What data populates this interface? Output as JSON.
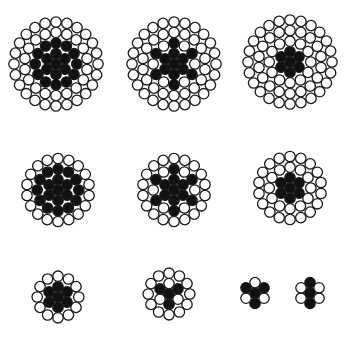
{
  "colors": {
    "background": "#ffffff",
    "steel": "#111111",
    "wire_fill": "#ffffff",
    "outline": "#1a1a1a"
  },
  "wire_radius": 5.2,
  "cross_sections": [
    {
      "id": "a",
      "cx": 56,
      "cy": 64,
      "rings": [
        {
          "n": 1,
          "r": 0,
          "fill": "steel"
        },
        {
          "n": 6,
          "r": 10.4,
          "fill": "steel"
        },
        {
          "n": 12,
          "r": 20.8,
          "fill": "steel"
        },
        {
          "n": 18,
          "r": 31.5,
          "fill": "white"
        },
        {
          "n": 24,
          "r": 42,
          "fill": "white"
        }
      ],
      "outer_only": false
    },
    {
      "id": "b",
      "cx": 174,
      "cy": 64,
      "rings": [
        {
          "n": 1,
          "r": 0,
          "fill": "steel"
        },
        {
          "n": 6,
          "r": 10.4,
          "fill": "steel"
        },
        {
          "n": 12,
          "r": 20.8,
          "fill": "star"
        },
        {
          "n": 18,
          "r": 31.5,
          "fill": "white"
        },
        {
          "n": 24,
          "r": 42,
          "fill": "white"
        }
      ]
    },
    {
      "id": "c",
      "cx": 290,
      "cy": 62,
      "rings": [
        {
          "n": 1,
          "r": 0,
          "fill": "steel"
        },
        {
          "n": 6,
          "r": 10.4,
          "fill": "steel"
        },
        {
          "n": 12,
          "r": 20.8,
          "fill": "white"
        },
        {
          "n": 18,
          "r": 31.5,
          "fill": "white"
        },
        {
          "n": 24,
          "r": 42,
          "fill": "white"
        }
      ]
    },
    {
      "id": "d",
      "cx": 58,
      "cy": 190,
      "rings": [
        {
          "n": 1,
          "r": 0,
          "fill": "steel"
        },
        {
          "n": 6,
          "r": 10.4,
          "fill": "steel"
        },
        {
          "n": 12,
          "r": 20.8,
          "fill": "steel"
        },
        {
          "n": 18,
          "r": 31.5,
          "fill": "white"
        }
      ]
    },
    {
      "id": "e",
      "cx": 174,
      "cy": 190,
      "rings": [
        {
          "n": 1,
          "r": 0,
          "fill": "steel"
        },
        {
          "n": 6,
          "r": 10.4,
          "fill": "steel"
        },
        {
          "n": 12,
          "r": 20.8,
          "fill": "star"
        },
        {
          "n": 18,
          "r": 31.5,
          "fill": "white"
        }
      ]
    },
    {
      "id": "f",
      "cx": 290,
      "cy": 188,
      "rings": [
        {
          "n": 1,
          "r": 0,
          "fill": "steel"
        },
        {
          "n": 6,
          "r": 10.4,
          "fill": "steel"
        },
        {
          "n": 12,
          "r": 20.8,
          "fill": "white"
        },
        {
          "n": 18,
          "r": 31.5,
          "fill": "white"
        }
      ]
    },
    {
      "id": "g",
      "cx": 58,
      "cy": 297,
      "rings": [
        {
          "n": 1,
          "r": 0,
          "fill": "steel"
        },
        {
          "n": 6,
          "r": 10.4,
          "fill": "steel"
        },
        {
          "n": 12,
          "r": 20.8,
          "fill": "white"
        }
      ]
    },
    {
      "id": "h",
      "cx": 169,
      "cy": 294,
      "rings": [
        {
          "n": 1,
          "r": 0,
          "fill": "steel"
        },
        {
          "n": 6,
          "r": 10.4,
          "fill": "alt"
        },
        {
          "n": 12,
          "r": 20.8,
          "fill": "white"
        }
      ]
    },
    {
      "id": "i",
      "cx": 255,
      "cy": 293,
      "rings": [
        {
          "n": 1,
          "r": 0,
          "fill": "steel"
        },
        {
          "n": 6,
          "r": 10.4,
          "fill": "tri"
        }
      ]
    },
    {
      "id": "j",
      "cx": 310,
      "cy": 293,
      "rings": [
        {
          "n": 1,
          "r": 0,
          "fill": "steel"
        },
        {
          "n": 6,
          "r": 10.4,
          "fill": "bar"
        }
      ]
    }
  ]
}
